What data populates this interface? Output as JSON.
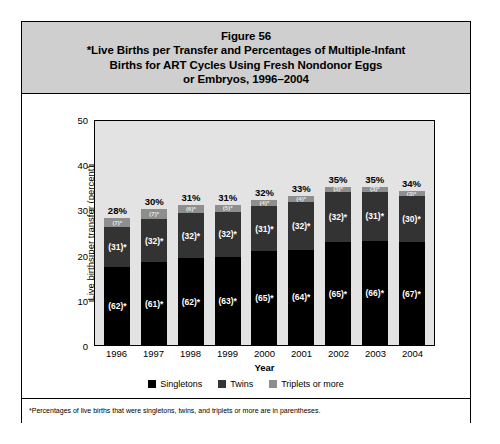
{
  "figure": {
    "title_lines": [
      "Figure 56",
      "*Live Births per Transfer and Percentages of Multiple-Infant",
      "Births for ART Cycles Using Fresh Nondonor Eggs",
      "or Embryos, 1996–2004"
    ],
    "footnote": "*Percentages of live births that were singletons, twins, and triplets or more are in parentheses."
  },
  "colors": {
    "singletons": "#000000",
    "twins": "#333333",
    "triplets": "#8e8e8e",
    "plot_background": "#e3e3e3",
    "title_background": "#cfcfcf"
  },
  "chart_data": {
    "type": "bar",
    "stacked": true,
    "title": "*Live Births per Transfer and Percentages of Multiple-Infant Births for ART Cycles Using Fresh Nondonor Eggs or Embryos, 1996–2004",
    "xlabel": "Year",
    "ylabel": "Live births per transfer (percent)",
    "ylim": [
      0,
      50
    ],
    "yticks": [
      0,
      10,
      20,
      30,
      40,
      50
    ],
    "ytick_labels": [
      "0",
      "10",
      "20",
      "30",
      "40",
      "50"
    ],
    "grid": false,
    "legend_position": "bottom",
    "categories": [
      "1996",
      "1997",
      "1998",
      "1999",
      "2000",
      "2001",
      "2002",
      "2003",
      "2004"
    ],
    "totals": [
      28,
      30,
      31,
      31,
      32,
      33,
      35,
      35,
      34
    ],
    "total_labels": [
      "28%",
      "30%",
      "31%",
      "31%",
      "32%",
      "33%",
      "35%",
      "35%",
      "34%"
    ],
    "series": [
      {
        "name": "Singletons",
        "color": "#000000",
        "share_percent": [
          62,
          61,
          62,
          63,
          65,
          64,
          65,
          66,
          67
        ],
        "share_labels": [
          "(62)*",
          "(61)*",
          "(62)*",
          "(63)*",
          "(65)*",
          "(64)*",
          "(65)*",
          "(66)*",
          "(67)*"
        ]
      },
      {
        "name": "Twins",
        "color": "#333333",
        "share_percent": [
          31,
          32,
          32,
          32,
          31,
          32,
          32,
          31,
          30
        ],
        "share_labels": [
          "(31)*",
          "(32)*",
          "(32)*",
          "(32)*",
          "(31)*",
          "(32)*",
          "(32)*",
          "(31)*",
          "(30)*"
        ]
      },
      {
        "name": "Triplets or more",
        "color": "#8e8e8e",
        "share_percent": [
          7,
          7,
          6,
          5,
          4,
          4,
          3,
          3,
          3
        ],
        "share_labels": [
          "(7)*",
          "(7)*",
          "(6)*",
          "(5)*",
          "(4)*",
          "(4)*",
          "(3)*",
          "(3)*",
          "(3)*"
        ]
      }
    ],
    "legend": [
      "Singletons",
      "Twins",
      "Triplets or more"
    ]
  }
}
